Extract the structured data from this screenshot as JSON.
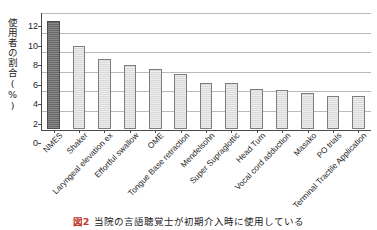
{
  "chart_data": {
    "type": "bar",
    "title": "",
    "xlabel": "",
    "ylabel": "使用者の割合(%)",
    "ylim": [
      0,
      12
    ],
    "ytick_step": 2,
    "ytick_labels": [
      "0",
      "2",
      "4",
      "6",
      "8",
      "10",
      "12"
    ],
    "grid": true,
    "legend": "none",
    "categories": [
      "NMES",
      "Shaker",
      "Laryngeal elevation ex",
      "Effortful swallow",
      "OME",
      "Tongue Base retraction",
      "Mendelsohn",
      "Super Supraglottic",
      "Head Turn",
      "Vocal cord adduction",
      "Masako",
      "PO trials",
      "Terminal Tractile Application"
    ],
    "values": [
      11.1,
      8.5,
      7.2,
      6.6,
      6.2,
      5.6,
      4.7,
      4.7,
      4.1,
      4.05,
      3.7,
      3.35,
      3.35
    ],
    "highlight_index": 0,
    "colors": {
      "bar_default": "#d9d9d9",
      "bar_highlight": "#6e6e6e",
      "bar_border": "#7d7d7d",
      "gridline": "#b9b9b9",
      "axis": "#4a4a4a",
      "caption_figno": "#c0392b"
    }
  },
  "caption": {
    "figure_number": "図2",
    "text": "当院の言語聴覚士が初期介入時に使用している"
  }
}
